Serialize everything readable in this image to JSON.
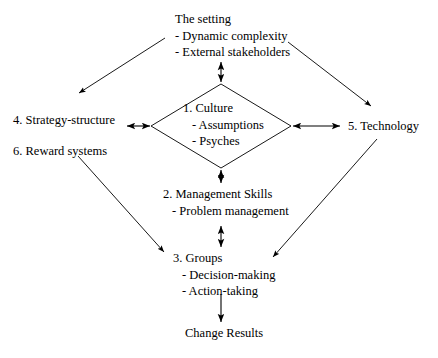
{
  "diagram": {
    "background_color": "#ffffff",
    "line_color": "#000000",
    "text_color": "#000000",
    "nodes": {
      "setting": {
        "heading": "The setting",
        "bullet_1": "- Dynamic complexity",
        "bullet_2": "- External stakeholders"
      },
      "culture": {
        "heading": "1. Culture",
        "bullet_1": "- Assumptions",
        "bullet_2": "- Psyches"
      },
      "strategy": {
        "heading": "4. Strategy-structure"
      },
      "reward": {
        "heading": "6. Reward systems"
      },
      "technology": {
        "heading": "5. Technology"
      },
      "management": {
        "heading": "2. Management Skills",
        "bullet_1": "- Problem management"
      },
      "groups": {
        "heading": "3. Groups",
        "bullet_1": "- Decision-making",
        "bullet_2": "- Action-taking"
      },
      "change": {
        "heading": "Change Results"
      }
    },
    "connectors": [
      {
        "name": "setting-to-culture",
        "style": "double-headed-arrow",
        "orientation": "vertical"
      },
      {
        "name": "culture-to-strategy",
        "style": "double-headed-arrow",
        "orientation": "horizontal"
      },
      {
        "name": "culture-to-technology",
        "style": "double-headed-arrow",
        "orientation": "horizontal"
      },
      {
        "name": "management-to-culture",
        "style": "double-headed-arrow",
        "orientation": "vertical"
      },
      {
        "name": "groups-to-management",
        "style": "double-headed-arrow",
        "orientation": "vertical"
      },
      {
        "name": "groups-to-change",
        "style": "single-arrow",
        "orientation": "vertical"
      },
      {
        "name": "setting-to-strategy-diagonal",
        "style": "single-arrow",
        "orientation": "diagonal"
      },
      {
        "name": "setting-to-technology-diagonal",
        "style": "single-arrow",
        "orientation": "diagonal"
      },
      {
        "name": "reward-to-groups-diagonal",
        "style": "single-arrow",
        "orientation": "diagonal"
      },
      {
        "name": "technology-to-groups-diagonal",
        "style": "single-arrow",
        "orientation": "diagonal"
      }
    ]
  }
}
